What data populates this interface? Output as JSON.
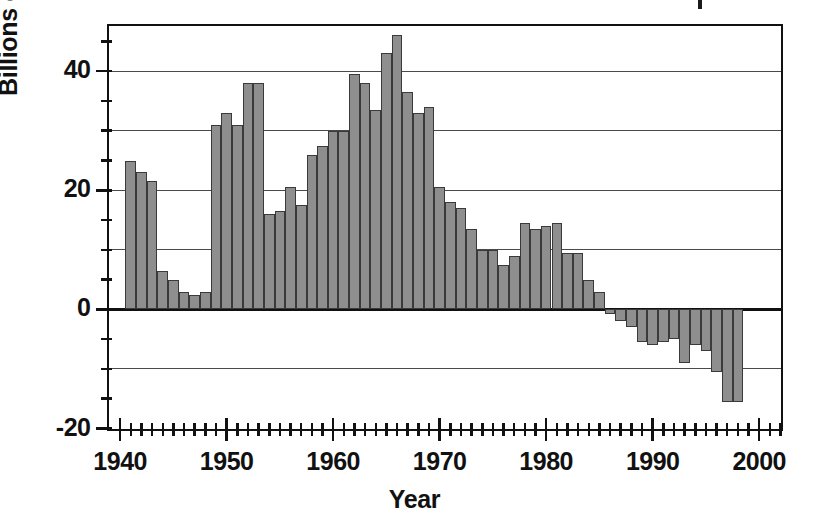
{
  "chart_data": {
    "type": "bar",
    "title": "",
    "xlabel": "Year",
    "ylabel": "Billions of barrels",
    "xlim": [
      1939.0,
      2002.0
    ],
    "ylim": [
      -20,
      47.5
    ],
    "grid": true,
    "legend": null,
    "y_major_labels": [
      "40",
      "20",
      "0",
      "-20"
    ],
    "y_major_values": [
      40,
      20,
      0,
      -20
    ],
    "y_gridline_values": [
      40,
      30,
      20,
      10,
      0,
      -10
    ],
    "y_tick_values": [
      45,
      40,
      35,
      30,
      25,
      20,
      15,
      10,
      5,
      0,
      -5,
      -10,
      -15,
      -20
    ],
    "x_major_labels": [
      "1940",
      "1950",
      "1960",
      "1970",
      "1980",
      "1990",
      "2000"
    ],
    "x_major_values": [
      1940,
      1950,
      1960,
      1970,
      1980,
      1990,
      2000
    ],
    "x_tick_step": 1,
    "bar_color": "#8e8e8e",
    "bar_edge_color": "#3a3a3a",
    "axis_color": "#111111",
    "categories": [
      1941,
      1942,
      1943,
      1944,
      1945,
      1946,
      1947,
      1948,
      1949,
      1950,
      1951,
      1952,
      1953,
      1954,
      1955,
      1956,
      1957,
      1958,
      1959,
      1960,
      1961,
      1962,
      1963,
      1964,
      1965,
      1966,
      1967,
      1968,
      1969,
      1970,
      1971,
      1972,
      1973,
      1974,
      1975,
      1976,
      1977,
      1978,
      1979,
      1980,
      1981,
      1982,
      1983,
      1984,
      1985,
      1986,
      1987,
      1988,
      1989,
      1990,
      1991,
      1992,
      1993,
      1994,
      1995,
      1996,
      1997,
      1998
    ],
    "values": [
      25.0,
      23.0,
      21.5,
      6.5,
      5.0,
      3.0,
      2.5,
      3.0,
      31.0,
      33.0,
      31.0,
      38.0,
      38.0,
      16.0,
      16.5,
      20.5,
      17.5,
      26.0,
      27.5,
      30.0,
      30.0,
      39.5,
      38.0,
      33.5,
      43.0,
      46.0,
      36.5,
      33.0,
      34.0,
      20.5,
      18.0,
      17.0,
      13.5,
      10.0,
      10.0,
      7.5,
      9.0,
      14.5,
      13.5,
      14.0,
      14.5,
      9.5,
      9.5,
      5.0,
      3.0,
      -0.8,
      -2.0,
      -3.0,
      -5.5,
      -6.0,
      -5.5,
      -5.0,
      -9.0,
      -6.0,
      -7.0,
      -10.5,
      -15.5,
      -15.5
    ]
  }
}
